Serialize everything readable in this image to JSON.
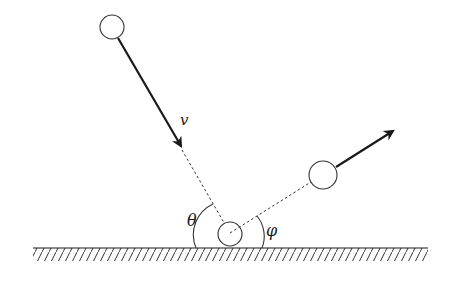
{
  "diagram": {
    "labels": {
      "velocity": "v",
      "incident_angle": "θ",
      "reflected_angle": "φ"
    },
    "colors": {
      "stroke": "#1a1a1a",
      "background": "#ffffff"
    },
    "elements": {
      "incoming_ball": {
        "cx": 112,
        "cy": 27,
        "r": 12
      },
      "impact_ball": {
        "cx": 230,
        "cy": 233,
        "r": 12
      },
      "outgoing_ball": {
        "cx": 323,
        "cy": 175,
        "r": 14
      },
      "ground_y": 248,
      "ground_x": [
        33,
        428
      ]
    }
  }
}
